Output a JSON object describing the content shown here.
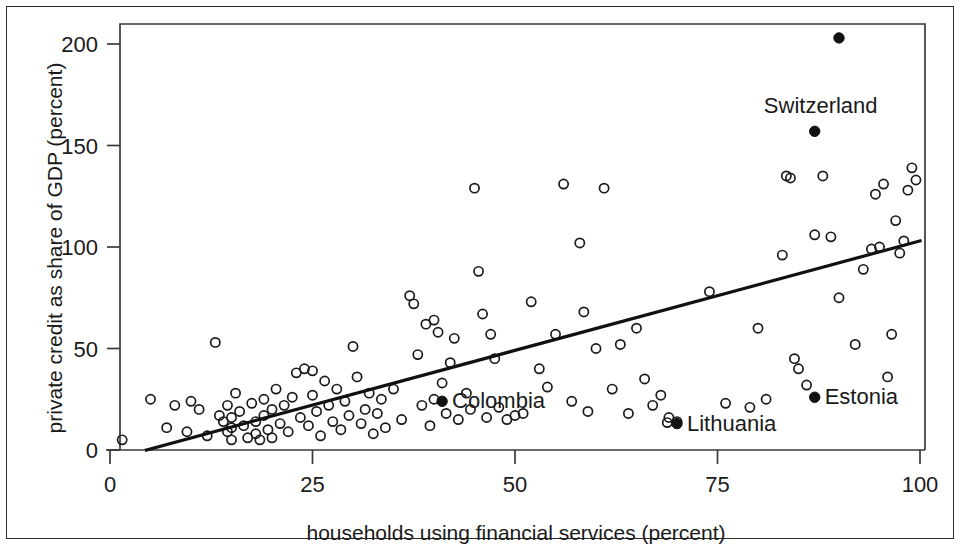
{
  "figure": {
    "background_color": "#ffffff",
    "border_color": "#2b2b2b",
    "point_color": "#1a1a1a",
    "line_color": "#111111"
  },
  "chart_data": {
    "type": "scatter",
    "title": "",
    "subtitle": "",
    "xlabel": "households using financial services (percent)",
    "ylabel": "private credit as share of GDP (percent)",
    "xlim": [
      0,
      100
    ],
    "ylim": [
      0,
      210
    ],
    "xticks": [
      0,
      25,
      50,
      75,
      100
    ],
    "xtick_labels": [
      "0",
      "25",
      "50",
      "75",
      "100"
    ],
    "yticks": [
      0,
      50,
      100,
      150,
      200
    ],
    "ytick_labels": [
      "0",
      "50",
      "100",
      "150",
      "200"
    ],
    "grid": false,
    "legend": false,
    "legend_position": "none",
    "marker_styles": {
      "unlabeled": "open-circle",
      "highlighted": "filled-circle"
    },
    "series": [
      {
        "name": "countries",
        "marker": "open-circle",
        "points": [
          [
            1.5,
            5
          ],
          [
            5,
            25
          ],
          [
            7,
            11
          ],
          [
            8,
            22
          ],
          [
            9.5,
            9
          ],
          [
            10,
            24
          ],
          [
            11,
            20
          ],
          [
            12,
            7
          ],
          [
            13,
            53
          ],
          [
            13.5,
            17
          ],
          [
            14,
            14
          ],
          [
            14.5,
            22
          ],
          [
            14.5,
            9
          ],
          [
            15,
            16
          ],
          [
            15,
            11
          ],
          [
            15,
            5
          ],
          [
            15.5,
            28
          ],
          [
            16,
            19
          ],
          [
            16.5,
            12
          ],
          [
            17,
            6
          ],
          [
            17.5,
            23
          ],
          [
            18,
            14
          ],
          [
            18,
            8
          ],
          [
            18.5,
            5
          ],
          [
            19,
            25
          ],
          [
            19,
            17
          ],
          [
            19.5,
            10
          ],
          [
            20,
            20
          ],
          [
            20,
            6
          ],
          [
            20.5,
            30
          ],
          [
            21,
            13
          ],
          [
            21.5,
            22
          ],
          [
            22,
            9
          ],
          [
            22.5,
            26
          ],
          [
            23,
            38
          ],
          [
            23.5,
            16
          ],
          [
            24,
            40
          ],
          [
            24.5,
            12
          ],
          [
            25,
            39
          ],
          [
            25,
            27
          ],
          [
            25.5,
            19
          ],
          [
            26,
            7
          ],
          [
            26.5,
            34
          ],
          [
            27,
            22
          ],
          [
            27.5,
            14
          ],
          [
            28,
            30
          ],
          [
            28.5,
            10
          ],
          [
            29,
            24
          ],
          [
            29.5,
            17
          ],
          [
            30,
            51
          ],
          [
            30.5,
            36
          ],
          [
            31,
            13
          ],
          [
            31.5,
            20
          ],
          [
            32,
            28
          ],
          [
            32.5,
            8
          ],
          [
            33,
            18
          ],
          [
            33.5,
            25
          ],
          [
            34,
            11
          ],
          [
            35,
            30
          ],
          [
            36,
            15
          ],
          [
            37,
            76
          ],
          [
            37.5,
            72
          ],
          [
            38,
            47
          ],
          [
            38.5,
            22
          ],
          [
            39,
            62
          ],
          [
            39.5,
            12
          ],
          [
            40,
            64
          ],
          [
            40.5,
            58
          ],
          [
            41,
            33
          ],
          [
            41.5,
            18
          ],
          [
            42,
            43
          ],
          [
            42.5,
            55
          ],
          [
            43,
            15
          ],
          [
            44,
            28
          ],
          [
            44.5,
            20
          ],
          [
            45,
            129
          ],
          [
            45.5,
            88
          ],
          [
            46,
            67
          ],
          [
            46.5,
            16
          ],
          [
            47,
            57
          ],
          [
            47.5,
            45
          ],
          [
            48,
            21
          ],
          [
            49,
            15
          ],
          [
            50,
            17
          ],
          [
            51,
            18
          ],
          [
            52,
            73
          ],
          [
            53,
            40
          ],
          [
            54,
            31
          ],
          [
            55,
            57
          ],
          [
            56,
            131
          ],
          [
            57,
            24
          ],
          [
            58,
            102
          ],
          [
            58.5,
            68
          ],
          [
            59,
            19
          ],
          [
            60,
            50
          ],
          [
            61,
            129
          ],
          [
            62,
            30
          ],
          [
            63,
            52
          ],
          [
            64,
            18
          ],
          [
            65,
            60
          ],
          [
            66,
            35
          ],
          [
            67,
            22
          ],
          [
            68,
            27
          ],
          [
            69,
            16
          ],
          [
            70,
            14
          ],
          [
            74,
            78
          ],
          [
            76,
            23
          ],
          [
            79,
            21
          ],
          [
            80,
            60
          ],
          [
            81,
            25
          ],
          [
            83,
            96
          ],
          [
            83.5,
            135
          ],
          [
            84,
            134
          ],
          [
            84.5,
            45
          ],
          [
            85,
            40
          ],
          [
            86,
            32
          ],
          [
            87,
            106
          ],
          [
            88,
            135
          ],
          [
            89,
            105
          ],
          [
            90,
            75
          ],
          [
            92,
            52
          ],
          [
            93,
            89
          ],
          [
            94,
            99
          ],
          [
            94.5,
            126
          ],
          [
            95,
            100
          ],
          [
            95.5,
            131
          ],
          [
            96,
            36
          ],
          [
            96.5,
            57
          ],
          [
            97,
            113
          ],
          [
            97.5,
            97
          ],
          [
            98,
            103
          ],
          [
            98.5,
            128
          ],
          [
            99,
            139
          ],
          [
            99.5,
            133
          ]
        ]
      }
    ],
    "highlighted_points": [
      {
        "label": "Switzerland",
        "x": 87,
        "y": 157,
        "label_dx": 6,
        "label_dy": -18,
        "label_anchor": "middle"
      },
      {
        "label": "Colombia",
        "x": 41,
        "y": 24,
        "label_dx": 10,
        "label_dy": 7,
        "label_anchor": "start"
      },
      {
        "label": "Lithuania",
        "x": 70,
        "y": 13,
        "label_dx": 10,
        "label_dy": 7,
        "label_anchor": "start"
      },
      {
        "label": "Estonia",
        "x": 87,
        "y": 26,
        "label_dx": 10,
        "label_dy": 7,
        "label_anchor": "start"
      },
      {
        "label": "",
        "x": 90,
        "y": 203,
        "label_dx": 0,
        "label_dy": 0,
        "label_anchor": "start"
      }
    ],
    "companion_points": [
      {
        "x": 40,
        "y": 25
      },
      {
        "x": 68.8,
        "y": 13.5
      }
    ],
    "fit_line": {
      "name": "regression line",
      "x0": 4.5,
      "y0": 0,
      "x1": 100,
      "y1": 103
    }
  }
}
